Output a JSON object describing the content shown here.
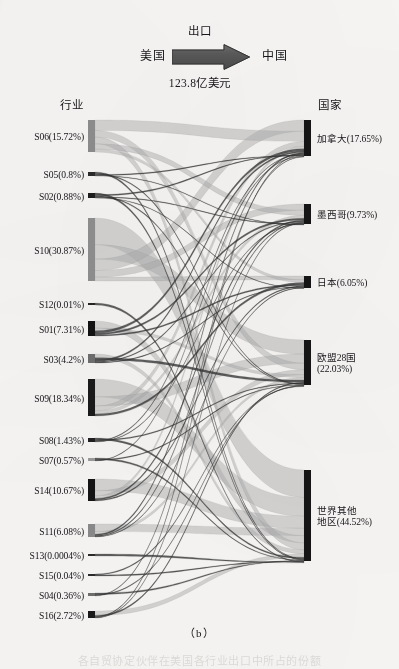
{
  "figure": {
    "caption": "（b）",
    "cut_caption": "各自贸协定伙伴在美国各行业出口中所占的份额",
    "header": {
      "origin": "美国",
      "destination": "中国",
      "flow_type": "出口",
      "amount": "123.8亿美元",
      "arrow_icon": "right-arrow-icon"
    },
    "column_headers": {
      "left": "行业",
      "right": "国家"
    }
  },
  "chart_data": {
    "type": "sankey",
    "title": "出口",
    "subtitle": "123.8亿美元",
    "xlabel": "行业",
    "ylabel": "国家",
    "value_unit": "%",
    "source_label": "美国",
    "target_label": "中国",
    "nodes_left": [
      {
        "id": "S06",
        "label": "S06(15.72%)",
        "value": 15.72,
        "y_top": 24,
        "y_bottom": 56,
        "shade": "#8d8d8d"
      },
      {
        "id": "S05",
        "label": "S05(0.8%)",
        "value": 0.8,
        "y_top": 76,
        "y_bottom": 80,
        "shade": "#2a2a2a"
      },
      {
        "id": "S02",
        "label": "S02(0.88%)",
        "value": 0.88,
        "y_top": 97,
        "y_bottom": 102,
        "shade": "#1d1d1d"
      },
      {
        "id": "S10",
        "label": "S10(30.87%)",
        "value": 30.87,
        "y_top": 122,
        "y_bottom": 185,
        "shade": "#8f8f8f"
      },
      {
        "id": "S12",
        "label": "S12(0.01%)",
        "value": 0.01,
        "y_top": 207,
        "y_bottom": 209,
        "shade": "#242424"
      },
      {
        "id": "S01",
        "label": "S01(7.31%)",
        "value": 7.31,
        "y_top": 225,
        "y_bottom": 240,
        "shade": "#121212"
      },
      {
        "id": "S03",
        "label": "S03(4.2%)",
        "value": 4.2,
        "y_top": 258,
        "y_bottom": 267,
        "shade": "#6f6f6f"
      },
      {
        "id": "S09",
        "label": "S09(18.34%)",
        "value": 18.34,
        "y_top": 283,
        "y_bottom": 320,
        "shade": "#1a1a1a"
      },
      {
        "id": "S08",
        "label": "S08(1.43%)",
        "value": 1.43,
        "y_top": 342,
        "y_bottom": 346,
        "shade": "#1f1f1f"
      },
      {
        "id": "S07",
        "label": "S07(0.57%)",
        "value": 0.57,
        "y_top": 362,
        "y_bottom": 365,
        "shade": "#9b9b9b"
      },
      {
        "id": "S14",
        "label": "S14(10.67%)",
        "value": 10.67,
        "y_top": 383,
        "y_bottom": 405,
        "shade": "#141414"
      },
      {
        "id": "S11",
        "label": "S11(6.08%)",
        "value": 6.08,
        "y_top": 428,
        "y_bottom": 441,
        "shade": "#8a8a8a"
      },
      {
        "id": "S13",
        "label": "S13(0.0004%)",
        "value": 0.0004,
        "y_top": 458,
        "y_bottom": 460,
        "shade": "#2b2b2b"
      },
      {
        "id": "S15",
        "label": "S15(0.04%)",
        "value": 0.04,
        "y_top": 478,
        "y_bottom": 480,
        "shade": "#2b2b2b"
      },
      {
        "id": "S04",
        "label": "S04(0.36%)",
        "value": 0.36,
        "y_top": 497,
        "y_bottom": 500,
        "shade": "#6e6e6e"
      },
      {
        "id": "S16",
        "label": "S16(2.72%)",
        "value": 2.72,
        "y_top": 515,
        "y_bottom": 522,
        "shade": "#1a1a1a"
      }
    ],
    "nodes_right": [
      {
        "id": "CA",
        "label": "加拿大(17.65%)",
        "label_line1": "加拿大(17.65%)",
        "label_line2": "",
        "value": 17.65,
        "y_top": 24,
        "y_bottom": 60,
        "shade": "#151515"
      },
      {
        "id": "MX",
        "label": "墨西哥(9.73%)",
        "label_line1": "墨西哥(9.73%)",
        "label_line2": "",
        "value": 9.73,
        "y_top": 108,
        "y_bottom": 128,
        "shade": "#151515"
      },
      {
        "id": "JP",
        "label": "日本(6.05%)",
        "label_line1": "日本(6.05%)",
        "label_line2": "",
        "value": 6.05,
        "y_top": 180,
        "y_bottom": 192,
        "shade": "#151515"
      },
      {
        "id": "EU",
        "label": "欧盟28国(22.03%)",
        "label_line1": "欧盟28国",
        "label_line2": "(22.03%)",
        "value": 22.03,
        "y_top": 244,
        "y_bottom": 289,
        "shade": "#151515"
      },
      {
        "id": "ROW",
        "label": "世界其他地区(44.52%)",
        "label_line1": "世界其他",
        "label_line2": "地区(44.52%)",
        "value": 44.52,
        "y_top": 374,
        "y_bottom": 465,
        "shade": "#151515"
      }
    ],
    "links": [
      {
        "source": "S06",
        "target": "CA",
        "value": 5.1
      },
      {
        "source": "S06",
        "target": "MX",
        "value": 2.6
      },
      {
        "source": "S06",
        "target": "JP",
        "value": 1.4
      },
      {
        "source": "S06",
        "target": "EU",
        "value": 3.3
      },
      {
        "source": "S06",
        "target": "ROW",
        "value": 3.3
      },
      {
        "source": "S05",
        "target": "CA",
        "value": 0.18
      },
      {
        "source": "S05",
        "target": "MX",
        "value": 0.1
      },
      {
        "source": "S05",
        "target": "EU",
        "value": 0.2
      },
      {
        "source": "S05",
        "target": "ROW",
        "value": 0.32
      },
      {
        "source": "S02",
        "target": "CA",
        "value": 0.2
      },
      {
        "source": "S02",
        "target": "MX",
        "value": 0.12
      },
      {
        "source": "S02",
        "target": "JP",
        "value": 0.08
      },
      {
        "source": "S02",
        "target": "EU",
        "value": 0.18
      },
      {
        "source": "S02",
        "target": "ROW",
        "value": 0.3
      },
      {
        "source": "S10",
        "target": "CA",
        "value": 5.6
      },
      {
        "source": "S10",
        "target": "MX",
        "value": 3.2
      },
      {
        "source": "S10",
        "target": "JP",
        "value": 1.9
      },
      {
        "source": "S10",
        "target": "EU",
        "value": 7.1
      },
      {
        "source": "S10",
        "target": "ROW",
        "value": 13.0
      },
      {
        "source": "S12",
        "target": "ROW",
        "value": 0.01
      },
      {
        "source": "S01",
        "target": "CA",
        "value": 1.1
      },
      {
        "source": "S01",
        "target": "MX",
        "value": 0.8
      },
      {
        "source": "S01",
        "target": "JP",
        "value": 0.6
      },
      {
        "source": "S01",
        "target": "EU",
        "value": 1.4
      },
      {
        "source": "S01",
        "target": "ROW",
        "value": 3.4
      },
      {
        "source": "S03",
        "target": "CA",
        "value": 0.7
      },
      {
        "source": "S03",
        "target": "MX",
        "value": 0.4
      },
      {
        "source": "S03",
        "target": "JP",
        "value": 0.3
      },
      {
        "source": "S03",
        "target": "EU",
        "value": 1.0
      },
      {
        "source": "S03",
        "target": "ROW",
        "value": 1.8
      },
      {
        "source": "S09",
        "target": "CA",
        "value": 2.4
      },
      {
        "source": "S09",
        "target": "MX",
        "value": 1.5
      },
      {
        "source": "S09",
        "target": "JP",
        "value": 1.0
      },
      {
        "source": "S09",
        "target": "EU",
        "value": 4.6
      },
      {
        "source": "S09",
        "target": "ROW",
        "value": 8.8
      },
      {
        "source": "S08",
        "target": "CA",
        "value": 0.3
      },
      {
        "source": "S08",
        "target": "MX",
        "value": 0.18
      },
      {
        "source": "S08",
        "target": "EU",
        "value": 0.35
      },
      {
        "source": "S08",
        "target": "ROW",
        "value": 0.6
      },
      {
        "source": "S07",
        "target": "CA",
        "value": 0.12
      },
      {
        "source": "S07",
        "target": "EU",
        "value": 0.15
      },
      {
        "source": "S07",
        "target": "ROW",
        "value": 0.3
      },
      {
        "source": "S14",
        "target": "CA",
        "value": 1.3
      },
      {
        "source": "S14",
        "target": "MX",
        "value": 0.7
      },
      {
        "source": "S14",
        "target": "JP",
        "value": 0.5
      },
      {
        "source": "S14",
        "target": "EU",
        "value": 2.5
      },
      {
        "source": "S14",
        "target": "ROW",
        "value": 5.7
      },
      {
        "source": "S11",
        "target": "CA",
        "value": 0.6
      },
      {
        "source": "S11",
        "target": "MX",
        "value": 0.4
      },
      {
        "source": "S11",
        "target": "JP",
        "value": 0.25
      },
      {
        "source": "S11",
        "target": "EU",
        "value": 1.3
      },
      {
        "source": "S11",
        "target": "ROW",
        "value": 3.5
      },
      {
        "source": "S13",
        "target": "ROW",
        "value": 0.0004
      },
      {
        "source": "S15",
        "target": "EU",
        "value": 0.02
      },
      {
        "source": "S15",
        "target": "ROW",
        "value": 0.02
      },
      {
        "source": "S04",
        "target": "CA",
        "value": 0.08
      },
      {
        "source": "S04",
        "target": "EU",
        "value": 0.1
      },
      {
        "source": "S04",
        "target": "ROW",
        "value": 0.18
      },
      {
        "source": "S16",
        "target": "CA",
        "value": 0.3
      },
      {
        "source": "S16",
        "target": "MX",
        "value": 0.2
      },
      {
        "source": "S16",
        "target": "EU",
        "value": 0.5
      },
      {
        "source": "S16",
        "target": "ROW",
        "value": 1.7
      }
    ]
  }
}
